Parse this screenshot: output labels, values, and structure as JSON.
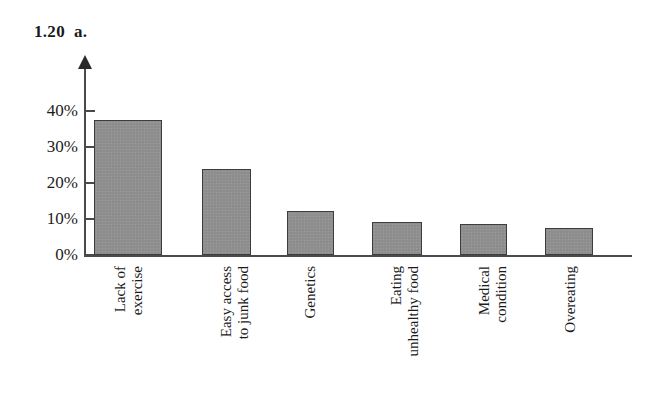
{
  "figure": {
    "number": "1.20",
    "part": "a."
  },
  "chart_data": {
    "type": "bar",
    "xlabel": "",
    "ylabel": "",
    "categories": [
      "Lack of exercise",
      "Easy access to junk food",
      "Genetics",
      "Eating unhealthy food",
      "Medical condition",
      "Overeating"
    ],
    "category_lines": [
      [
        "Lack of",
        "exercise"
      ],
      [
        "Easy access",
        "to junk food"
      ],
      [
        "Genetics"
      ],
      [
        "Eating",
        "unhealthy food"
      ],
      [
        "Medical",
        "condition"
      ],
      [
        "Overeating"
      ]
    ],
    "values": [
      37.5,
      23.8,
      12.2,
      9.1,
      8.7,
      7.4
    ],
    "ylim": [
      0,
      45
    ],
    "yticks": [
      0,
      10,
      20,
      30,
      40
    ],
    "ytick_labels": [
      "0%",
      "10%",
      "20%",
      "30%",
      "40%"
    ],
    "grid": false,
    "legend": null,
    "bar_color": "#8f8f8f",
    "bar_edge_color": "#3d3d3d",
    "axis_color": "#4a4a4a",
    "background_color": "#ffffff"
  }
}
